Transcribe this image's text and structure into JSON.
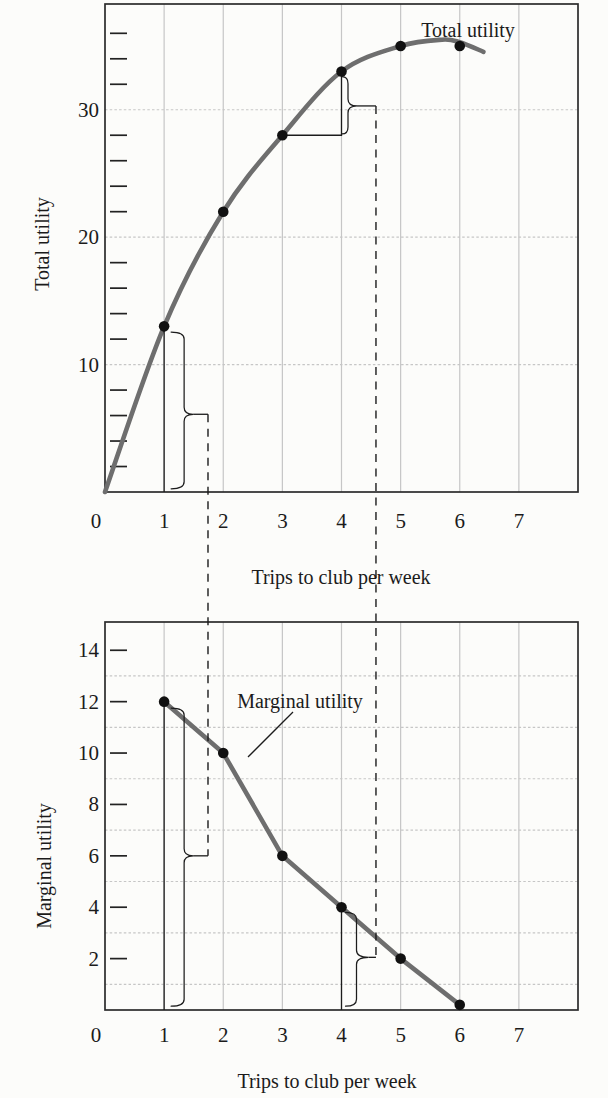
{
  "figure": {
    "background": "#fcfcfa"
  },
  "colors": {
    "curve": "#6e6e6e",
    "dot": "#111111",
    "grid": "#c6c6c6",
    "frame": "#2b2b2b",
    "annotation": "#1c1c1c",
    "text": "#1b1b1b"
  },
  "chart_data": [
    {
      "id": "total-utility-chart",
      "type": "line",
      "curve_label": "Total utility",
      "ylabel": "Total utility",
      "xlabel": "Trips to club per week",
      "x": [
        1,
        2,
        3,
        4,
        5,
        6
      ],
      "values": [
        13,
        22,
        28,
        33,
        35,
        35
      ],
      "curve_points": [
        [
          0,
          0
        ],
        [
          1,
          13
        ],
        [
          2,
          22
        ],
        [
          3,
          28
        ],
        [
          4,
          33
        ],
        [
          5,
          35
        ],
        [
          5.7,
          35.5
        ],
        [
          6,
          35.3
        ],
        [
          6.4,
          34.55
        ]
      ],
      "smooth": true,
      "xlim": [
        0,
        8
      ],
      "ylim": [
        0,
        38.3
      ],
      "x_tick_labels": [
        0,
        1,
        2,
        3,
        4,
        5,
        6,
        7
      ],
      "y_tick_labels": [
        10,
        20,
        30
      ],
      "y_tick_marks": [
        2,
        4,
        6,
        8,
        12,
        14,
        16,
        18,
        22,
        24,
        26,
        28,
        32,
        34,
        36
      ],
      "grid_x": [
        1,
        2,
        3,
        4,
        5,
        6,
        7
      ],
      "grid_y": [
        10,
        20,
        30
      ],
      "legend_position": "top-right"
    },
    {
      "id": "marginal-utility-chart",
      "type": "line",
      "curve_label": "Marginal utility",
      "ylabel": "Marginal utility",
      "xlabel": "Trips to club per week",
      "x": [
        1,
        2,
        3,
        4,
        5,
        6
      ],
      "values": [
        12,
        10,
        6,
        4,
        2,
        0.2
      ],
      "curve_points": [
        [
          1,
          12
        ],
        [
          2,
          10
        ],
        [
          3,
          6
        ],
        [
          4,
          4
        ],
        [
          5,
          2
        ],
        [
          6,
          0.2
        ]
      ],
      "smooth": false,
      "xlim": [
        0,
        8
      ],
      "ylim": [
        0,
        15.1
      ],
      "x_tick_labels": [
        0,
        1,
        2,
        3,
        4,
        5,
        6,
        7
      ],
      "y_tick_labels": [
        2,
        4,
        6,
        8,
        10,
        12,
        14
      ],
      "y_tick_marks": [
        2,
        4,
        6,
        8,
        10,
        12,
        14
      ],
      "grid_x": [
        1,
        2,
        3,
        4,
        5,
        6,
        7
      ],
      "grid_y": [
        1,
        3,
        5,
        7,
        9,
        11,
        13
      ],
      "legend_position": "inner-top"
    }
  ],
  "annotations": {
    "stems": [
      {
        "chart": 0,
        "x": 1,
        "y_from": 0,
        "y_to": 13
      },
      {
        "chart": 1,
        "x": 1,
        "y_from": 0,
        "y_to": 12
      },
      {
        "chart": 1,
        "x": 4,
        "y_from": 0,
        "y_to": 4
      }
    ],
    "step": {
      "chart": 0,
      "points": [
        [
          3,
          28
        ],
        [
          4,
          28
        ],
        [
          4,
          33
        ]
      ]
    },
    "braces": [
      {
        "chart": 0,
        "x": 1,
        "y1": 0.25,
        "y2": 12.55,
        "cusp": 6.1,
        "dx": 20,
        "tip": 9,
        "hook": 13
      },
      {
        "chart": 0,
        "x": 4,
        "y1": 28.1,
        "y2": 32.6,
        "cusp": 30.3,
        "dx": 6.5,
        "tip": 9,
        "hook": 6
      },
      {
        "chart": 1,
        "x": 1,
        "y1": 0.15,
        "y2": 11.75,
        "cusp": 6.0,
        "dx": 20,
        "tip": 9,
        "hook": 13
      },
      {
        "chart": 1,
        "x": 4,
        "y1": 0.15,
        "y2": 3.8,
        "cusp": 2.05,
        "dx": 15,
        "tip": 12,
        "hook": 11
      }
    ],
    "guides": [
      {
        "x": 1.742,
        "top_brace": 0,
        "bottom_brace": 2
      },
      {
        "x": 4.583,
        "top_brace": 1,
        "bottom_brace": 3
      }
    ],
    "marginal_pointer": {
      "x1": 293,
      "y1": 712,
      "x2": 248,
      "y2": 757
    }
  }
}
